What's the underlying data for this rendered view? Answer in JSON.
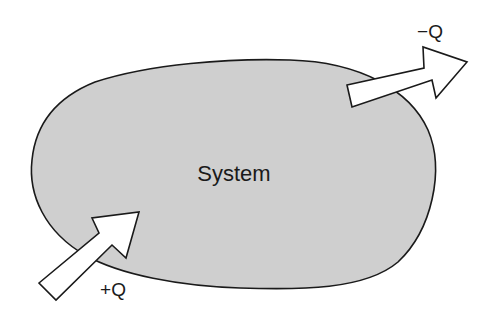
{
  "diagram": {
    "system": {
      "label": "System",
      "fill": "#cfcfcf",
      "stroke": "#1a1a1a"
    },
    "arrows": [
      {
        "name": "heat-in",
        "label": "+Q",
        "direction": "into system"
      },
      {
        "name": "heat-out",
        "label": "−Q",
        "direction": "out of system"
      }
    ],
    "colors": {
      "background": "#ffffff",
      "arrow_fill": "#ffffff",
      "outline": "#1a1a1a"
    }
  }
}
